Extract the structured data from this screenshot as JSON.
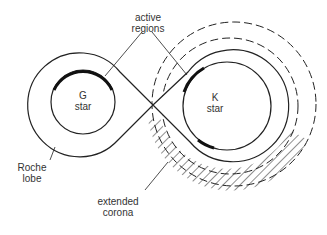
{
  "diagram": {
    "labels": {
      "active_regions_1": "active",
      "active_regions_2": "regions",
      "g_star_1": "G",
      "g_star_2": "star",
      "k_star_1": "K",
      "k_star_2": "star",
      "roche_1": "Roche",
      "roche_2": "lobe",
      "corona_1": "extended",
      "corona_2": "corona"
    }
  }
}
